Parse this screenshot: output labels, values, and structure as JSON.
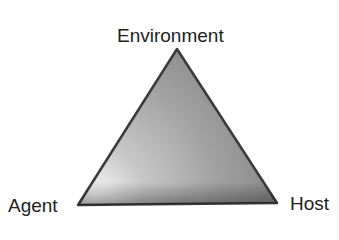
{
  "diagram": {
    "type": "triangle",
    "vertices": [
      {
        "id": "top",
        "label": "Environment"
      },
      {
        "id": "bottom-left",
        "label": "Agent"
      },
      {
        "id": "bottom-right",
        "label": "Host"
      }
    ],
    "colors": {
      "edge": "#3a3a3a",
      "fill_light": "#f4f4f4",
      "fill_mid": "#a8a8a8",
      "fill_dark": "#6e6e6e",
      "text": "#1e1e1e"
    }
  }
}
